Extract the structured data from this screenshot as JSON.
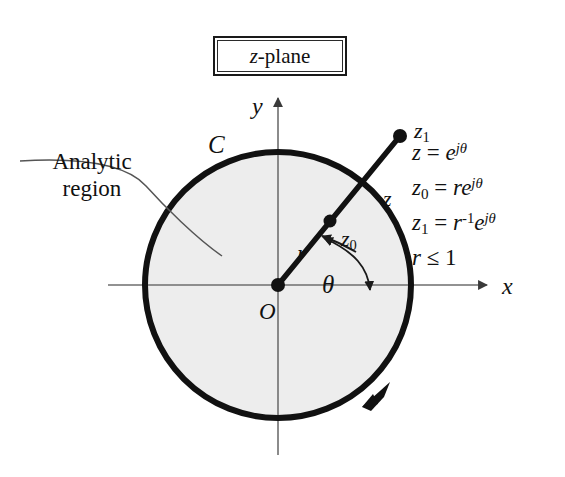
{
  "figure": {
    "title_prefix": "z",
    "title_suffix": "-plane",
    "domain": "complex z-plane unit circle diagram"
  },
  "annotations": {
    "analytic_region_line1": "Analytic",
    "analytic_region_line2": "region",
    "contour_label": "C",
    "origin_label": "O",
    "axis_y": "y",
    "axis_x": "x",
    "radius_label": "r",
    "angle_label": "θ",
    "point_z": "z",
    "point_z0_base": "z",
    "point_z0_sub": "0",
    "point_z1_base": "z",
    "point_z1_sub": "1"
  },
  "equations": [
    {
      "lhs": "z",
      "lhs_sub": "",
      "rhs_coeff": "",
      "rhs_coeff_sup": "",
      "rhs_base": "e",
      "rhs_exp": "jθ"
    },
    {
      "lhs": "z",
      "lhs_sub": "0",
      "rhs_coeff": "r",
      "rhs_coeff_sup": "",
      "rhs_base": "e",
      "rhs_exp": "jθ"
    },
    {
      "lhs": "z",
      "lhs_sub": "1",
      "rhs_coeff": "r",
      "rhs_coeff_sup": "-1",
      "rhs_base": "e",
      "rhs_exp": "jθ"
    }
  ],
  "constraint": {
    "symbol": "r",
    "relation": "≤",
    "value": "1"
  },
  "geometry": {
    "center_x": 278,
    "center_y": 285,
    "radius": 133,
    "angle_degrees": 40,
    "r_inner_fraction": 0.48,
    "r_outer_fraction": 1.52,
    "contour_direction": "counterclockwise"
  },
  "colors": {
    "contour_stroke": "#111111",
    "region_fill": "#ededed",
    "axis_stroke": "#6e6e6e",
    "text": "#111111",
    "leader_stroke": "#555555"
  }
}
